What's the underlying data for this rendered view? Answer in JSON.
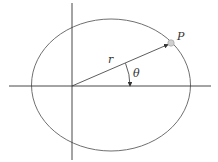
{
  "diagram": {
    "title": "",
    "labels": {
      "point": "P",
      "radius": "r",
      "angle": "θ"
    },
    "colors": {
      "curve": "#707070",
      "axes": "#333333",
      "point_fill": "#d0d0d0",
      "text": "#333333"
    },
    "geometry": {
      "origin": [
        72,
        86
      ],
      "ellipse_center": [
        111,
        85
      ],
      "ellipse_rx": 79.5,
      "ellipse_ry": 66,
      "point_P": [
        171,
        43
      ]
    }
  }
}
